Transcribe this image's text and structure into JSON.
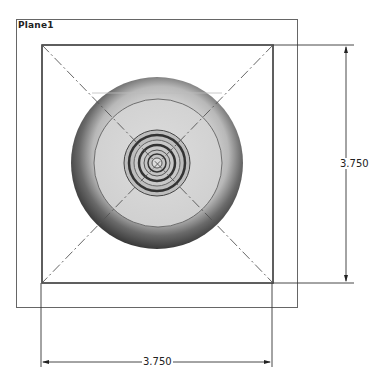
{
  "sketch": {
    "plane_label": "Plane1",
    "dimensions": {
      "vertical": "3.750",
      "horizontal": "3.750"
    }
  },
  "colors": {
    "line": "#2a2a2a",
    "plane_frame": "#555555",
    "centerline": "#555555"
  }
}
